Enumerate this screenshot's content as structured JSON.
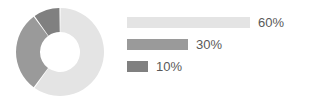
{
  "chart_data": {
    "type": "pie",
    "title": "",
    "subtitle": "",
    "xlabel": "",
    "ylabel": "",
    "grid": false,
    "legend_position": "right",
    "donut": true,
    "inner_radius_ratio": 0.455,
    "start_angle_deg": 0,
    "direction": "clockwise",
    "categories": [
      "Segment 1",
      "Segment 2",
      "Segment 3"
    ],
    "values": [
      60,
      30,
      10
    ],
    "value_labels": [
      "60%",
      "30%",
      "10%"
    ],
    "colors": [
      "#e4e4e4",
      "#9a9a9a",
      "#808080"
    ],
    "bar_track_width_px": 183,
    "slices": [
      {
        "label": "60%",
        "value": 60,
        "color": "#e4e4e4",
        "bar_width_px": 123,
        "start_angle_deg": 0,
        "end_angle_deg": 216
      },
      {
        "label": "30%",
        "value": 30,
        "color": "#9a9a9a",
        "bar_width_px": 61,
        "start_angle_deg": 216,
        "end_angle_deg": 324
      },
      {
        "label": "10%",
        "value": 10,
        "color": "#808080",
        "bar_width_px": 21,
        "start_angle_deg": 324,
        "end_angle_deg": 360
      }
    ]
  },
  "figure": {
    "background_color": "#ffffff",
    "text_color": "#595959"
  }
}
